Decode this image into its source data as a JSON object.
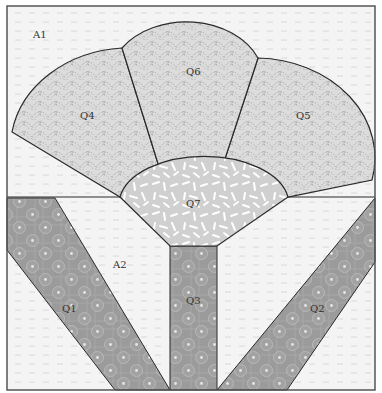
{
  "diagram": {
    "type": "quilt-block-pattern",
    "colors": {
      "background_fabric": "#f4f4f4",
      "background_dots": "#b8b8b8",
      "fan_fabric": "#dadada",
      "fan_dots": "#9a9a9a",
      "center_fabric": "#d2d2d2",
      "center_dashes": "#ffffff",
      "strip_fabric": "#9a9a9a",
      "strip_circles": "#c4c4c4",
      "outline": "#2a2a2a",
      "border": "#555555"
    },
    "pieces": {
      "A1": {
        "label": "A1",
        "region": "upper background"
      },
      "A2": {
        "label": "A2",
        "region": "lower background"
      },
      "Q1": {
        "label": "Q1",
        "region": "left diagonal strip"
      },
      "Q2": {
        "label": "Q2",
        "region": "right diagonal strip"
      },
      "Q3": {
        "label": "Q3",
        "region": "center vertical stem"
      },
      "Q4": {
        "label": "Q4",
        "region": "left fan blade"
      },
      "Q5": {
        "label": "Q5",
        "region": "right fan blade"
      },
      "Q6": {
        "label": "Q6",
        "region": "top fan blade"
      },
      "Q7": {
        "label": "Q7",
        "region": "fan center"
      }
    }
  }
}
